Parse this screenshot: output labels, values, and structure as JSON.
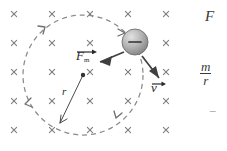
{
  "figure": {
    "type": "physics-diagram",
    "background_color": "#ffffff",
    "ink_color": "#4a4a4a",
    "field": {
      "symbol": "×",
      "meaning": "magnetic-field-into-page",
      "color": "#7a7a7a",
      "rows_y": [
        14,
        43,
        72,
        101,
        130
      ],
      "cols_x": [
        14,
        52,
        90,
        128,
        166
      ],
      "count": 25
    },
    "orbit": {
      "center_x": 83,
      "center_y": 75,
      "radius": 60,
      "style": "dashed",
      "color": "#8a8a8a",
      "direction": "counterclockwise"
    },
    "particle": {
      "label": "−",
      "charge_sign": "negative",
      "x": 135,
      "y": 42,
      "radius": 13,
      "fill_light": "#d8d8d8",
      "fill_dark": "#8e8e8e"
    },
    "center_dot": {
      "x": 83,
      "y": 75,
      "radius": 2.2,
      "color": "#333333"
    }
  },
  "labels": {
    "force": {
      "base": "F",
      "subscript": "m",
      "accent": "vector-arrow",
      "x": 78,
      "y": 50
    },
    "velocity": {
      "base": "v",
      "accent": "vector-arrow",
      "x": 152,
      "y": 80
    },
    "radius": {
      "text": "r",
      "x": 63,
      "y": 93
    }
  },
  "equations": {
    "line1": {
      "text": "F",
      "x": 205,
      "y": 14
    },
    "line2": {
      "numerator": "m",
      "denominator": "r",
      "x": 200,
      "y": 62
    },
    "line3": {
      "text": "−",
      "x": 208,
      "y": 108
    }
  },
  "icons": {
    "field_cross": "cross-icon",
    "orbit_arrow": "arrowhead-icon",
    "force_arrow": "force-vector-arrow-icon",
    "velocity_arrow": "velocity-vector-arrow-icon",
    "radius_arrow": "radius-arrow-icon"
  }
}
